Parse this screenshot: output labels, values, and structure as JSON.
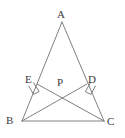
{
  "figure": {
    "name": "triangle-with-two-altitudes",
    "background_color": "#ffffff",
    "stroke_color": "#808080",
    "label_color": "#3c3c3c",
    "stroke_width": 1,
    "width": 125,
    "height": 138
  },
  "labels": {
    "a": "A",
    "b": "B",
    "c": "C",
    "d": "D",
    "e": "E",
    "p": "P"
  },
  "label_positions": {
    "a": {
      "x": 57,
      "y": 9
    },
    "b": {
      "x": 6,
      "y": 115
    },
    "c": {
      "x": 107,
      "y": 116
    },
    "d": {
      "x": 88,
      "y": 74
    },
    "e": {
      "x": 25,
      "y": 74
    },
    "p": {
      "x": 57,
      "y": 77
    }
  },
  "points": {
    "A": {
      "x": 62,
      "y": 22
    },
    "B": {
      "x": 22,
      "y": 121
    },
    "C": {
      "x": 104,
      "y": 121
    },
    "D": {
      "x": 87,
      "y": 84
    },
    "E": {
      "x": 37,
      "y": 84
    },
    "P": {
      "x": 62.5,
      "y": 90
    }
  },
  "segments": [
    {
      "name": "side-AB",
      "from": "A",
      "to": "B"
    },
    {
      "name": "side-AC",
      "from": "A",
      "to": "C"
    },
    {
      "name": "side-BC",
      "from": "B",
      "to": "C"
    },
    {
      "name": "altitude-BD",
      "from": "B",
      "to": "D"
    },
    {
      "name": "altitude-CE",
      "from": "C",
      "to": "E"
    }
  ],
  "right_angle_marks": [
    {
      "name": "right-angle-at-E",
      "vertex": "E",
      "size": 6
    },
    {
      "name": "right-angle-at-D",
      "vertex": "D",
      "size": 6
    }
  ]
}
